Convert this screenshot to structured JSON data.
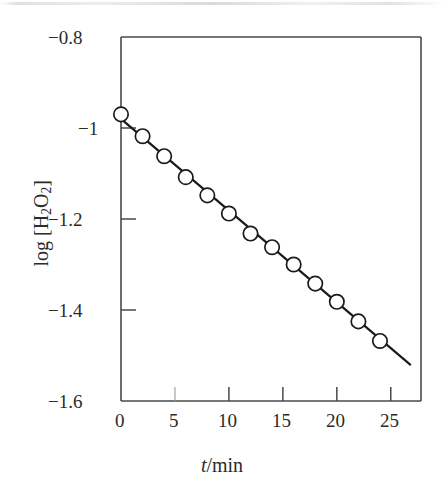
{
  "figure": {
    "background_color": "#ffffff",
    "ink_color": "#1a1a1a",
    "axis_color": "#4a4a4a"
  },
  "axes": {
    "x_title_prefix": "t",
    "x_title_suffix": "/min",
    "y_title_prefix": "log [H",
    "y_title_sub1": "2",
    "y_title_mid": "O",
    "y_title_sub2": "2",
    "y_title_suffix": "]"
  },
  "x_ticks": [
    {
      "value": 0,
      "label": "0"
    },
    {
      "value": 5,
      "label": "5"
    },
    {
      "value": 10,
      "label": "10"
    },
    {
      "value": 15,
      "label": "15"
    },
    {
      "value": 20,
      "label": "20"
    },
    {
      "value": 25,
      "label": "25"
    }
  ],
  "y_ticks": [
    {
      "value": -0.8,
      "label": "−0.8"
    },
    {
      "value": -1.0,
      "label": "−1"
    },
    {
      "value": -1.2,
      "label": "−1.2"
    },
    {
      "value": -1.4,
      "label": "−1.4"
    },
    {
      "value": -1.6,
      "label": "−1.6"
    }
  ],
  "chart_data": {
    "type": "scatter",
    "title": "",
    "subtitle": "",
    "xlabel": "t/min",
    "ylabel": "log [H2O2]",
    "xlim": [
      0,
      27.8
    ],
    "ylim": [
      -1.6,
      -0.8
    ],
    "grid": false,
    "legend": null,
    "x": [
      0,
      2,
      4,
      6,
      8,
      10,
      12,
      14,
      16,
      18,
      20,
      22,
      24
    ],
    "y": [
      -0.97,
      -1.018,
      -1.062,
      -1.108,
      -1.148,
      -1.188,
      -1.232,
      -1.262,
      -1.3,
      -1.342,
      -1.382,
      -1.425,
      -1.468
    ],
    "series": [
      {
        "name": "log [H2O2]",
        "marker": "open-circle",
        "values": [
          -0.97,
          -1.018,
          -1.062,
          -1.108,
          -1.148,
          -1.188,
          -1.232,
          -1.262,
          -1.3,
          -1.342,
          -1.382,
          -1.425,
          -1.468
        ]
      }
    ],
    "fit_line": {
      "type": "linear",
      "x_start": 0,
      "x_end": 26.8,
      "y_start": -0.98,
      "y_end": -1.52,
      "slope": -0.02015,
      "intercept": -0.98
    },
    "annotations": []
  }
}
